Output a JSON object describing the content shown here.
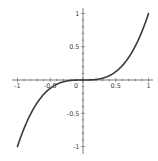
{
  "chart_data": {
    "type": "line",
    "title": "",
    "xlabel": "",
    "ylabel": "",
    "function": "y = x^3",
    "xlim": [
      -1,
      1
    ],
    "ylim": [
      -1,
      1
    ],
    "grid": false,
    "legend": null,
    "x_ticks": [
      -1,
      -0.5,
      0,
      0.5,
      1
    ],
    "x_tick_labels": [
      "-1",
      "-0.5",
      "0",
      "0.5",
      "1"
    ],
    "y_ticks": [
      -1,
      -0.5,
      0.5,
      1
    ],
    "y_tick_labels": [
      "-1",
      "-0.5",
      "0.5",
      "1"
    ],
    "minor_tick_step": 0.1,
    "series": [
      {
        "name": "x^3",
        "color": "#3a3a3a",
        "x": [
          -1,
          -0.9,
          -0.8,
          -0.7,
          -0.6,
          -0.5,
          -0.4,
          -0.3,
          -0.2,
          -0.1,
          0,
          0.1,
          0.2,
          0.3,
          0.4,
          0.5,
          0.6,
          0.7,
          0.8,
          0.9,
          1
        ],
        "y": [
          -1,
          -0.729,
          -0.512,
          -0.343,
          -0.216,
          -0.125,
          -0.064,
          -0.027,
          -0.008,
          -0.001,
          0,
          0.001,
          0.008,
          0.027,
          0.064,
          0.125,
          0.216,
          0.343,
          0.512,
          0.729,
          1
        ]
      }
    ]
  },
  "style": {
    "axis_color": "#5a5a5a",
    "curve_color": "#3a3a3a",
    "background": "#ffffff"
  },
  "layout": {
    "origin_px": [
      83,
      80
    ],
    "x_scale_px": 65.5,
    "y_scale_px": 66.5
  }
}
